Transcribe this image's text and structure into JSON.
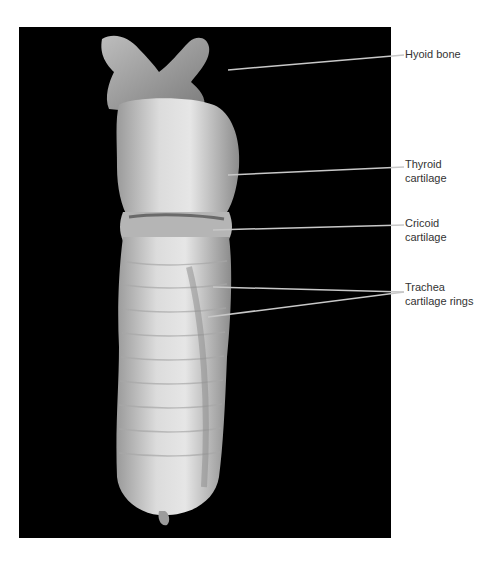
{
  "figure": {
    "background_color": "#000000",
    "specimen_color": "#d8d8d8",
    "leader_line_color": "#c8c8c8",
    "labels": [
      {
        "id": "hyoid",
        "text": "Hyoid bone",
        "top": 47
      },
      {
        "id": "thyroid",
        "text": "Thyroid\ncartilage",
        "top": 157
      },
      {
        "id": "cricoid",
        "text": "Cricoid\ncartilage",
        "top": 216
      },
      {
        "id": "trachea",
        "text": "Trachea\ncartilage rings",
        "top": 280
      }
    ]
  }
}
